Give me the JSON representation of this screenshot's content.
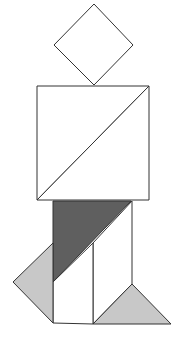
{
  "figure": {
    "kind": "tangram",
    "pieces": [
      {
        "name": "head-square",
        "shape": "square",
        "fill": "#ffffff"
      },
      {
        "name": "torso-upper-triangle",
        "shape": "large triangle",
        "fill": "#ffffff"
      },
      {
        "name": "torso-lower-triangle",
        "shape": "large triangle",
        "fill": "#ffffff"
      },
      {
        "name": "hip-parallelogram",
        "shape": "parallelogram",
        "fill": "#5f5f5f"
      },
      {
        "name": "leg-rectangle",
        "shape": "rectangle",
        "fill": "#ffffff"
      },
      {
        "name": "left-foot-triangle",
        "shape": "small triangle",
        "fill": "#c8c8c8"
      },
      {
        "name": "right-foot-triangle",
        "shape": "small triangle",
        "fill": "#c8c8c8"
      }
    ],
    "stroke": "#333333"
  }
}
